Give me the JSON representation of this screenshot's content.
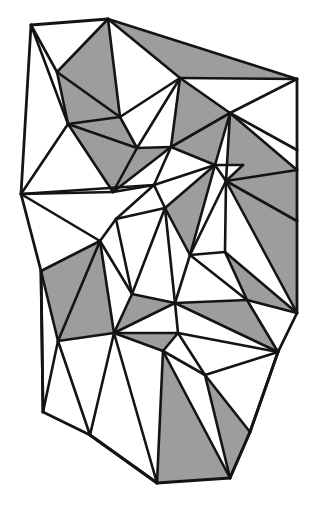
{
  "figure": {
    "name": "triangulated-polygon-mesh",
    "kind": "diagram",
    "canvas": {
      "width": 317,
      "height": 509,
      "background": "#ffffff"
    },
    "style": {
      "fill_shaded": "#9d9d9d",
      "fill_plain": "#ffffff",
      "edge_color": "#141414",
      "edge_width": 2.6,
      "outline_width": 2.8
    },
    "counts": {
      "vertices": 40,
      "triangles": 54,
      "shaded_triangles": 22
    },
    "vertices": {
      "v0": [
        31,
        25
      ],
      "v1": [
        108,
        19
      ],
      "v2": [
        297,
        79
      ],
      "v3": [
        21,
        194
      ],
      "v4": [
        68,
        124
      ],
      "v5": [
        113,
        192
      ],
      "v6": [
        180,
        78
      ],
      "v7": [
        230,
        113
      ],
      "v8": [
        137,
        148
      ],
      "v9": [
        171,
        147
      ],
      "v10": [
        120,
        117
      ],
      "v11": [
        57,
        72
      ],
      "v12": [
        297,
        150
      ],
      "v13": [
        226,
        181
      ],
      "v14": [
        297,
        170
      ],
      "v15": [
        297,
        221
      ],
      "v16": [
        243,
        165
      ],
      "v17": [
        215,
        165
      ],
      "v18": [
        154,
        185
      ],
      "v19": [
        100,
        241
      ],
      "v20": [
        41,
        271
      ],
      "v21": [
        116,
        219
      ],
      "v22": [
        165,
        208
      ],
      "v23": [
        190,
        255
      ],
      "v24": [
        225,
        252
      ],
      "v25": [
        297,
        313
      ],
      "v26": [
        114,
        333
      ],
      "v27": [
        175,
        303
      ],
      "v28": [
        163,
        351
      ],
      "v29": [
        247,
        300
      ],
      "v30": [
        278,
        352
      ],
      "v31": [
        43,
        412
      ],
      "v32": [
        90,
        435
      ],
      "v33": [
        157,
        483
      ],
      "v34": [
        230,
        478
      ],
      "v35": [
        205,
        375
      ],
      "v36": [
        250,
        432
      ],
      "v37": [
        178,
        333
      ],
      "v38": [
        58,
        341
      ],
      "v39": [
        132,
        294
      ]
    },
    "triangles": [
      {
        "id": "t01",
        "verts": [
          "v0",
          "v1",
          "v11"
        ],
        "shaded": false
      },
      {
        "id": "t02",
        "verts": [
          "v0",
          "v11",
          "v4"
        ],
        "shaded": false
      },
      {
        "id": "t03",
        "verts": [
          "v11",
          "v1",
          "v10"
        ],
        "shaded": true
      },
      {
        "id": "t04",
        "verts": [
          "v11",
          "v10",
          "v4"
        ],
        "shaded": true
      },
      {
        "id": "t05",
        "verts": [
          "v1",
          "v6",
          "v10"
        ],
        "shaded": false
      },
      {
        "id": "t06",
        "verts": [
          "v1",
          "v6",
          "v2"
        ],
        "shaded": true
      },
      {
        "id": "t07",
        "verts": [
          "v6",
          "v7",
          "v2"
        ],
        "shaded": false
      },
      {
        "id": "t08",
        "verts": [
          "v6",
          "v7",
          "v9"
        ],
        "shaded": true
      },
      {
        "id": "t09",
        "verts": [
          "v6",
          "v9",
          "v8"
        ],
        "shaded": false
      },
      {
        "id": "t10",
        "verts": [
          "v10",
          "v6",
          "v8"
        ],
        "shaded": false
      },
      {
        "id": "t11",
        "verts": [
          "v4",
          "v10",
          "v8"
        ],
        "shaded": true
      },
      {
        "id": "t12",
        "verts": [
          "v4",
          "v8",
          "v5"
        ],
        "shaded": true
      },
      {
        "id": "t13",
        "verts": [
          "v0",
          "v4",
          "v3"
        ],
        "shaded": false
      },
      {
        "id": "t14",
        "verts": [
          "v3",
          "v4",
          "v5"
        ],
        "shaded": false
      },
      {
        "id": "t15",
        "verts": [
          "v3",
          "v5",
          "v18"
        ],
        "shaded": true
      },
      {
        "id": "t16",
        "verts": [
          "v5",
          "v8",
          "v9"
        ],
        "shaded": true
      },
      {
        "id": "t17",
        "verts": [
          "v5",
          "v9",
          "v18"
        ],
        "shaded": false
      },
      {
        "id": "t18",
        "verts": [
          "v9",
          "v7",
          "v17"
        ],
        "shaded": true
      },
      {
        "id": "t19",
        "verts": [
          "v9",
          "v17",
          "v18"
        ],
        "shaded": false
      },
      {
        "id": "t20",
        "verts": [
          "v7",
          "v2",
          "v12"
        ],
        "shaded": false
      },
      {
        "id": "t21",
        "verts": [
          "v7",
          "v12",
          "v14"
        ],
        "shaded": false
      },
      {
        "id": "t22",
        "verts": [
          "v7",
          "v14",
          "v13"
        ],
        "shaded": true
      },
      {
        "id": "t23",
        "verts": [
          "v13",
          "v14",
          "v15"
        ],
        "shaded": true
      },
      {
        "id": "t24",
        "verts": [
          "v13",
          "v16",
          "v17"
        ],
        "shaded": false
      },
      {
        "id": "t25",
        "verts": [
          "v7",
          "v17",
          "v13"
        ],
        "shaded": false
      },
      {
        "id": "t26",
        "verts": [
          "v13",
          "v15",
          "v25"
        ],
        "shaded": true
      },
      {
        "id": "t27",
        "verts": [
          "v18",
          "v17",
          "v22"
        ],
        "shaded": false
      },
      {
        "id": "t28",
        "verts": [
          "v18",
          "v22",
          "v21"
        ],
        "shaded": false
      },
      {
        "id": "t29",
        "verts": [
          "v3",
          "v18",
          "v21"
        ],
        "shaded": false
      },
      {
        "id": "t30",
        "verts": [
          "v3",
          "v21",
          "v19"
        ],
        "shaded": false
      },
      {
        "id": "t31",
        "verts": [
          "v3",
          "v19",
          "v20"
        ],
        "shaded": false
      },
      {
        "id": "t32",
        "verts": [
          "v22",
          "v17",
          "v23"
        ],
        "shaded": true
      },
      {
        "id": "t33",
        "verts": [
          "v17",
          "v13",
          "v23"
        ],
        "shaded": false
      },
      {
        "id": "t34",
        "verts": [
          "v13",
          "v23",
          "v24"
        ],
        "shaded": false
      },
      {
        "id": "t35",
        "verts": [
          "v13",
          "v24",
          "v25"
        ],
        "shaded": false
      },
      {
        "id": "t36",
        "verts": [
          "v24",
          "v25",
          "v29"
        ],
        "shaded": true
      },
      {
        "id": "t37",
        "verts": [
          "v20",
          "v19",
          "v38"
        ],
        "shaded": true
      },
      {
        "id": "t38",
        "verts": [
          "v19",
          "v39",
          "v26"
        ],
        "shaded": false
      },
      {
        "id": "t39",
        "verts": [
          "v19",
          "v38",
          "v26"
        ],
        "shaded": true
      },
      {
        "id": "t40",
        "verts": [
          "v22",
          "v23",
          "v27"
        ],
        "shaded": false
      },
      {
        "id": "t41",
        "verts": [
          "v21",
          "v22",
          "v39"
        ],
        "shaded": false
      },
      {
        "id": "t42",
        "verts": [
          "v39",
          "v27",
          "v26"
        ],
        "shaded": true
      },
      {
        "id": "t43",
        "verts": [
          "v26",
          "v27",
          "v37"
        ],
        "shaded": false
      },
      {
        "id": "t44",
        "verts": [
          "v27",
          "v23",
          "v29"
        ],
        "shaded": false
      },
      {
        "id": "t45",
        "verts": [
          "v27",
          "v29",
          "v30"
        ],
        "shaded": true
      },
      {
        "id": "t46",
        "verts": [
          "v26",
          "v37",
          "v28"
        ],
        "shaded": true
      },
      {
        "id": "t47",
        "verts": [
          "v37",
          "v30",
          "v35"
        ],
        "shaded": false
      },
      {
        "id": "t48",
        "verts": [
          "v20",
          "v38",
          "v31"
        ],
        "shaded": false
      },
      {
        "id": "t49",
        "verts": [
          "v31",
          "v38",
          "v32"
        ],
        "shaded": false
      },
      {
        "id": "t50",
        "verts": [
          "v32",
          "v26",
          "v33"
        ],
        "shaded": false
      },
      {
        "id": "t51",
        "verts": [
          "v28",
          "v33",
          "v34"
        ],
        "shaded": true
      },
      {
        "id": "t52",
        "verts": [
          "v28",
          "v34",
          "v35"
        ],
        "shaded": false
      },
      {
        "id": "t53",
        "verts": [
          "v35",
          "v34",
          "v36"
        ],
        "shaded": true
      },
      {
        "id": "t54",
        "verts": [
          "v30",
          "v35",
          "v36"
        ],
        "shaded": false
      }
    ],
    "outline": [
      "v0",
      "v1",
      "v2",
      "v12",
      "v14",
      "v15",
      "v25",
      "v30",
      "v36",
      "v34",
      "v33",
      "v32",
      "v31",
      "v20",
      "v3"
    ],
    "edges": [
      [
        "v0",
        "v1"
      ],
      [
        "v1",
        "v2"
      ],
      [
        "v2",
        "v12"
      ],
      [
        "v12",
        "v14"
      ],
      [
        "v14",
        "v15"
      ],
      [
        "v15",
        "v25"
      ],
      [
        "v25",
        "v30"
      ],
      [
        "v30",
        "v36"
      ],
      [
        "v36",
        "v34"
      ],
      [
        "v34",
        "v33"
      ],
      [
        "v33",
        "v32"
      ],
      [
        "v32",
        "v31"
      ],
      [
        "v31",
        "v20"
      ],
      [
        "v20",
        "v3"
      ],
      [
        "v3",
        "v0"
      ],
      [
        "v0",
        "v11"
      ],
      [
        "v0",
        "v4"
      ],
      [
        "v11",
        "v1"
      ],
      [
        "v11",
        "v4"
      ],
      [
        "v11",
        "v10"
      ],
      [
        "v1",
        "v10"
      ],
      [
        "v1",
        "v6"
      ],
      [
        "v10",
        "v4"
      ],
      [
        "v10",
        "v6"
      ],
      [
        "v10",
        "v8"
      ],
      [
        "v6",
        "v2"
      ],
      [
        "v6",
        "v7"
      ],
      [
        "v6",
        "v9"
      ],
      [
        "v6",
        "v8"
      ],
      [
        "v7",
        "v2"
      ],
      [
        "v7",
        "v9"
      ],
      [
        "v8",
        "v9"
      ],
      [
        "v4",
        "v8"
      ],
      [
        "v4",
        "v5"
      ],
      [
        "v4",
        "v3"
      ],
      [
        "v5",
        "v8"
      ],
      [
        "v5",
        "v9"
      ],
      [
        "v5",
        "v3"
      ],
      [
        "v5",
        "v18"
      ],
      [
        "v9",
        "v17"
      ],
      [
        "v9",
        "v18"
      ],
      [
        "v7",
        "v12"
      ],
      [
        "v7",
        "v14"
      ],
      [
        "v7",
        "v13"
      ],
      [
        "v7",
        "v17"
      ],
      [
        "v13",
        "v14"
      ],
      [
        "v13",
        "v15"
      ],
      [
        "v13",
        "v16"
      ],
      [
        "v13",
        "v17"
      ],
      [
        "v13",
        "v23"
      ],
      [
        "v13",
        "v24"
      ],
      [
        "v13",
        "v25"
      ],
      [
        "v16",
        "v17"
      ],
      [
        "v18",
        "v17"
      ],
      [
        "v18",
        "v22"
      ],
      [
        "v18",
        "v21"
      ],
      [
        "v18",
        "v3"
      ],
      [
        "v22",
        "v21"
      ],
      [
        "v22",
        "v17"
      ],
      [
        "v22",
        "v23"
      ],
      [
        "v22",
        "v27"
      ],
      [
        "v22",
        "v39"
      ],
      [
        "v21",
        "v19"
      ],
      [
        "v21",
        "v39"
      ],
      [
        "v19",
        "v3"
      ],
      [
        "v19",
        "v20"
      ],
      [
        "v19",
        "v38"
      ],
      [
        "v19",
        "v39"
      ],
      [
        "v19",
        "v26"
      ],
      [
        "v17",
        "v23"
      ],
      [
        "v23",
        "v24"
      ],
      [
        "v23",
        "v27"
      ],
      [
        "v23",
        "v29"
      ],
      [
        "v24",
        "v25"
      ],
      [
        "v24",
        "v29"
      ],
      [
        "v25",
        "v29"
      ],
      [
        "v20",
        "v38"
      ],
      [
        "v20",
        "v31"
      ],
      [
        "v38",
        "v26"
      ],
      [
        "v38",
        "v31"
      ],
      [
        "v38",
        "v32"
      ],
      [
        "v39",
        "v27"
      ],
      [
        "v39",
        "v26"
      ],
      [
        "v27",
        "v26"
      ],
      [
        "v27",
        "v37"
      ],
      [
        "v27",
        "v29"
      ],
      [
        "v27",
        "v30"
      ],
      [
        "v29",
        "v30"
      ],
      [
        "v26",
        "v37"
      ],
      [
        "v26",
        "v28"
      ],
      [
        "v26",
        "v32"
      ],
      [
        "v26",
        "v33"
      ],
      [
        "v37",
        "v28"
      ],
      [
        "v37",
        "v30"
      ],
      [
        "v37",
        "v35"
      ],
      [
        "v28",
        "v33"
      ],
      [
        "v28",
        "v34"
      ],
      [
        "v28",
        "v35"
      ],
      [
        "v30",
        "v35"
      ],
      [
        "v30",
        "v36"
      ],
      [
        "v35",
        "v34"
      ],
      [
        "v35",
        "v36"
      ],
      [
        "v34",
        "v36"
      ],
      [
        "v32",
        "v33"
      ]
    ]
  }
}
